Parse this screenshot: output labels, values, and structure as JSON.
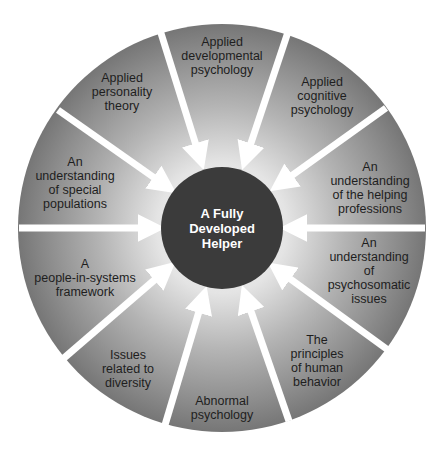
{
  "diagram": {
    "center": {
      "label": "A Fully\nDeveloped\nHelper"
    },
    "segments": [
      {
        "label": "Applied\ndevelopmental\npsychology"
      },
      {
        "label": "Applied\ncognitive\npsychology"
      },
      {
        "label": "An\nunderstanding\nof the helping\nprofessions"
      },
      {
        "label": "An\nunderstanding\nof psychosomatic\nissues"
      },
      {
        "label": "The\nprinciples\nof human\nbehavior"
      },
      {
        "label": "Abnormal\npsychology"
      },
      {
        "label": "Issues\nrelated to\ndiversity"
      },
      {
        "label": "A\npeople-in-systems\nframework"
      },
      {
        "label": "An\nunderstanding\nof special\npopulations"
      },
      {
        "label": "Applied\npersonality\ntheory"
      }
    ],
    "colors": {
      "outer_edge": "#7a7a7a",
      "inner_glow": "#ececec",
      "center_fill": "#3b3b3b",
      "arrow": "#ffffff",
      "center_text": "#ffffff",
      "label_text": "#1e1e1e"
    }
  }
}
